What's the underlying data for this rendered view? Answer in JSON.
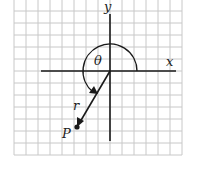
{
  "diagram": {
    "type": "polar-coordinate-diagram",
    "labels": {
      "x_axis": "x",
      "y_axis": "y",
      "angle": "θ",
      "radius": "r",
      "point": "P"
    },
    "grid": {
      "left": 14,
      "right": 182,
      "top": 0,
      "bottom": 155,
      "step": 12,
      "color": "#c8c8c8"
    },
    "origin": {
      "x": 110,
      "y": 71
    },
    "point_P": {
      "x": 77,
      "y": 127
    },
    "colors": {
      "ink": "#1a1a1a",
      "grid": "#c8c8c8",
      "background": "#ffffff"
    }
  }
}
